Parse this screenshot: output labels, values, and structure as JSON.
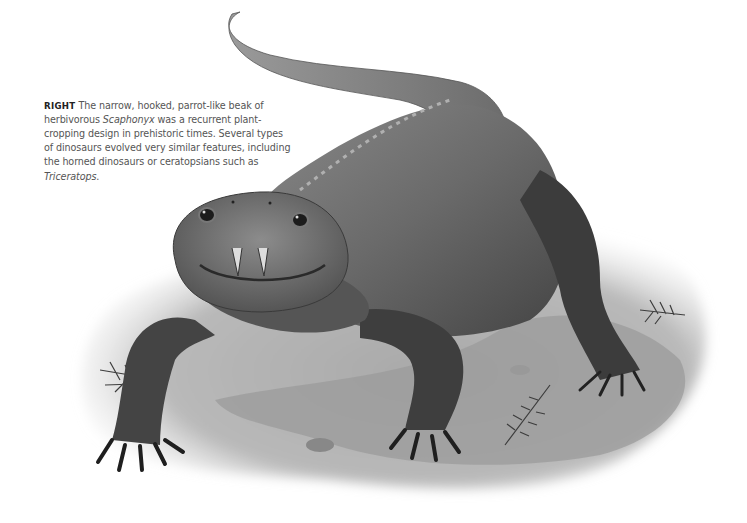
{
  "caption": {
    "label": "RIGHT",
    "text_part1": "The narrow, hooked, parrot-like beak of herbivorous ",
    "italic1": "Scaphonyx",
    "text_part2": " was a recurrent plant-cropping design in prehistoric times. Several types of dinosaurs evolved very similar features, including the horned dinosaurs or ceratopsians such as ",
    "italic2": "Triceratops",
    "text_part3": "."
  },
  "illustration": {
    "subject": "Scaphonyx",
    "description": "Grayscale painting of a rhynchosaur walking toward the viewer on a rocky ground patch with small ferns",
    "colors": {
      "body_dark": "#3a3a3a",
      "body_mid": "#6e6e6e",
      "body_light": "#9a9a9a",
      "ground": "#b5b5b5",
      "ground_light": "#e2e2e2"
    }
  }
}
